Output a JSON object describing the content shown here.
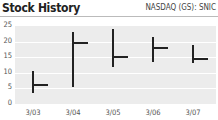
{
  "header": {
    "title": "Stock History",
    "ticker": "NASDAQ (GS): SNIC"
  },
  "chart_data": {
    "type": "ohlc",
    "title": "Stock History",
    "subtitle": "NASDAQ (GS): SNIC",
    "categories": [
      "3/03",
      "3/04",
      "3/05",
      "3/06",
      "3/07"
    ],
    "series": [
      {
        "name": "high",
        "values": [
          10.5,
          23,
          24,
          21.5,
          19
        ]
      },
      {
        "name": "low",
        "values": [
          3.5,
          5.5,
          12,
          13.5,
          13
        ]
      },
      {
        "name": "close",
        "values": [
          6,
          19.5,
          15,
          18,
          14.5
        ]
      }
    ],
    "yticks": [
      "0",
      "5",
      "10",
      "15",
      "20",
      "25"
    ],
    "ylim": [
      0,
      25
    ],
    "xlabel": "",
    "ylabel": "",
    "grid": true,
    "legend": "none"
  }
}
